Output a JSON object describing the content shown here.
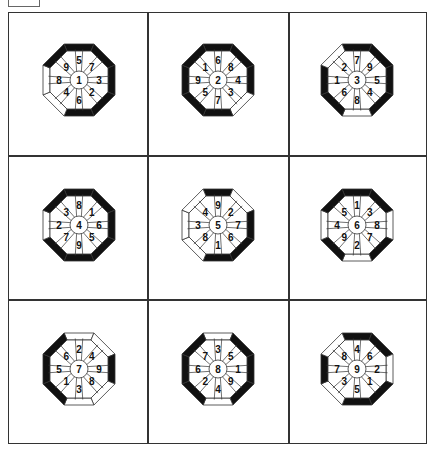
{
  "figure": {
    "edge_order": [
      "N",
      "NE",
      "E",
      "SE",
      "S",
      "SW",
      "W",
      "NW"
    ],
    "octagons": [
      {
        "center": "1",
        "labels": {
          "N": "5",
          "NE": "7",
          "E": "3",
          "SE": "2",
          "S": "6",
          "SW": "4",
          "W": "8",
          "NW": "9"
        },
        "edges": {
          "N": "black",
          "NE": "black",
          "E": "black",
          "SE": "black",
          "S": "black",
          "SW": "white",
          "W": "white",
          "NW": "black"
        }
      },
      {
        "center": "2",
        "labels": {
          "N": "6",
          "NE": "8",
          "E": "4",
          "SE": "3",
          "S": "7",
          "SW": "5",
          "W": "9",
          "NW": "1"
        },
        "edges": {
          "N": "black",
          "NE": "black",
          "E": "black",
          "SE": "white",
          "S": "black",
          "SW": "black",
          "W": "black",
          "NW": "black"
        }
      },
      {
        "center": "3",
        "labels": {
          "N": "7",
          "NE": "9",
          "E": "5",
          "SE": "4",
          "S": "8",
          "SW": "6",
          "W": "1",
          "NW": "2"
        },
        "edges": {
          "N": "black",
          "NE": "black",
          "E": "black",
          "SE": "black",
          "S": "white",
          "SW": "black",
          "W": "black",
          "NW": "white"
        }
      },
      {
        "center": "4",
        "labels": {
          "N": "8",
          "NE": "1",
          "E": "6",
          "SE": "5",
          "S": "9",
          "SW": "7",
          "W": "2",
          "NW": "3"
        },
        "edges": {
          "N": "black",
          "NE": "black",
          "E": "black",
          "SE": "black",
          "S": "black",
          "SW": "black",
          "W": "white",
          "NW": "black"
        }
      },
      {
        "center": "5",
        "labels": {
          "N": "9",
          "NE": "2",
          "E": "7",
          "SE": "6",
          "S": "1",
          "SW": "8",
          "W": "3",
          "NW": "4"
        },
        "edges": {
          "N": "black",
          "NE": "white",
          "E": "black",
          "SE": "black",
          "S": "black",
          "SW": "white",
          "W": "white",
          "NW": "white"
        }
      },
      {
        "center": "6",
        "labels": {
          "N": "1",
          "NE": "3",
          "E": "8",
          "SE": "7",
          "S": "2",
          "SW": "9",
          "W": "4",
          "NW": "5"
        },
        "edges": {
          "N": "black",
          "NE": "black",
          "E": "white",
          "SE": "black",
          "S": "white",
          "SW": "black",
          "W": "white",
          "NW": "black"
        }
      },
      {
        "center": "7",
        "labels": {
          "N": "2",
          "NE": "4",
          "E": "9",
          "SE": "8",
          "S": "3",
          "SW": "1",
          "W": "5",
          "NW": "6"
        },
        "edges": {
          "N": "white",
          "NE": "white",
          "E": "black",
          "SE": "white",
          "S": "white",
          "SW": "black",
          "W": "black",
          "NW": "black"
        }
      },
      {
        "center": "8",
        "labels": {
          "N": "3",
          "NE": "5",
          "E": "1",
          "SE": "9",
          "S": "4",
          "SW": "2",
          "W": "6",
          "NW": "7"
        },
        "edges": {
          "N": "white",
          "NE": "black",
          "E": "black",
          "SE": "black",
          "S": "white",
          "SW": "black",
          "W": "black",
          "NW": "black"
        }
      },
      {
        "center": "9",
        "labels": {
          "N": "4",
          "NE": "6",
          "E": "2",
          "SE": "1",
          "S": "5",
          "SW": "3",
          "W": "7",
          "NW": "8"
        },
        "edges": {
          "N": "black",
          "NE": "black",
          "E": "white",
          "SE": "black",
          "S": "black",
          "SW": "white",
          "W": "black",
          "NW": "white"
        }
      }
    ],
    "colors": {
      "black": "#111111",
      "white": "#ffffff",
      "line": "#333333"
    }
  }
}
